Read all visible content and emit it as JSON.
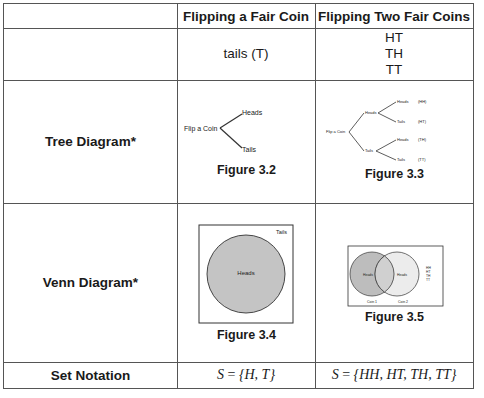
{
  "table": {
    "headers": [
      "",
      "Flipping a Fair Coin",
      "Flipping Two Fair Coins"
    ],
    "rows": [
      {
        "label": "",
        "one_coin": "tails (T)",
        "two_coins": [
          "HT",
          "TH",
          "TT"
        ]
      },
      {
        "label": "Tree Diagram*",
        "one_coin_figure": {
          "caption": "Figure 3.2",
          "root": "Flip a Coin",
          "branches": [
            "Heads",
            "Tails"
          ]
        },
        "two_coins_figure": {
          "caption": "Figure 3.3",
          "root": "Flip a Coin",
          "level1": [
            "Heads",
            "Tails"
          ],
          "level2": [
            "Heads",
            "Tails",
            "Heads",
            "Tails"
          ],
          "outcomes": [
            "(HH)",
            "(HT)",
            "(TH)",
            "(TT)"
          ]
        }
      },
      {
        "label": "Venn Diagram*",
        "one_coin_figure": {
          "caption": "Figure 3.4",
          "circle_label": "Heads",
          "outside_label": "Tails"
        },
        "two_coins_figure": {
          "caption": "Figure 3.5",
          "circle1_label": "Heads",
          "circle2_label": "Heads",
          "coin1_label": "Coin 1",
          "coin2_label": "Coin 2",
          "legend": [
            "HH",
            "HT",
            "TH",
            "TT"
          ]
        }
      },
      {
        "label": "Set Notation",
        "one_coin": {
          "s": "S",
          "eq": " = ",
          "set": "{H, T}"
        },
        "two_coins": {
          "s": "S",
          "eq": " = ",
          "set": "{HH, HT, TH, TT}"
        }
      }
    ]
  },
  "colors": {
    "border": "#555555",
    "circle_fill_dark": "#c4c4c4",
    "circle_fill_light": "#e4e4e4",
    "line": "#333333"
  }
}
